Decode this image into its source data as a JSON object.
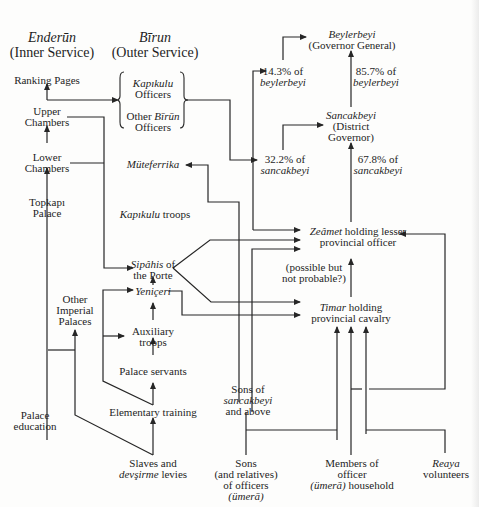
{
  "headers": {
    "enderun": {
      "italic": "Enderūn",
      "plain": "(Inner Service)"
    },
    "birun": {
      "italic": "Bīrun",
      "plain": "(Outer Service)"
    }
  },
  "inner_service": {
    "ranking_pages": "Ranking Pages",
    "upper_chambers": [
      "Upper",
      "Chambers"
    ],
    "lower_chambers": [
      "Lower",
      "Chambers"
    ],
    "topkapi_palace": [
      "Topkapı",
      "Palace"
    ],
    "other_imperial_palaces": [
      "Other",
      "Imperial",
      "Palaces"
    ],
    "palace_education": [
      "Palace",
      "education"
    ]
  },
  "outer_service": {
    "kapikulu_officers": {
      "italic": "Kapıkulu",
      "plain": "Officers"
    },
    "other_birun_officers": {
      "plain": "Other ",
      "italic": "Bīrūn",
      "line2": "Officers"
    },
    "muteferrika": "Müteferrika",
    "kapikulu_troops": {
      "italic": "Kapıkulu",
      "plain": " troops"
    },
    "sipahis": {
      "italic": "Sipâhis",
      "plain": " of",
      "line2": "the Porte"
    },
    "yeniceri": "Yeniçeri",
    "auxiliary_troops": [
      "Auxiliary",
      "troops"
    ],
    "palace_servants": "Palace servants",
    "elementary_training": "Elementary training",
    "slaves_levies": {
      "line1": "Slaves and",
      "italic": "devşirme",
      "plain": " levies"
    }
  },
  "provincial": {
    "beylerbeyi": {
      "italic": "Beylerbeyi",
      "plain": "(Governor General)"
    },
    "pct_14": {
      "value": "14.3% of",
      "italic": "beylerbeyi"
    },
    "pct_85": {
      "value": "85.7% of",
      "italic": "beylerbeyi"
    },
    "sancakbeyi": {
      "italic": "Sancakbeyi",
      "line2": "(District",
      "line3": "Governor)"
    },
    "pct_32": {
      "value": "32.2% of",
      "italic": "sancakbeyi"
    },
    "pct_67": {
      "value": "67.8% of",
      "italic": "sancakbeyi"
    },
    "zeamet": {
      "italic": "Zeâmet",
      "plain": " holding lesser",
      "line2": "provincial officer"
    },
    "possible": [
      "(possible but",
      "not probable?)"
    ],
    "timar": {
      "italic": "Timar",
      "plain": " holding",
      "line2": "provincial cavalry"
    }
  },
  "sources": {
    "sons_sancakbeyi": {
      "line1": "Sons of",
      "italic": "sancakbeyi",
      "line3": "and above"
    },
    "sons_officers": {
      "line1": "Sons",
      "line2": "(and relatives)",
      "line3": "of officers",
      "italic": "(ümerā)"
    },
    "household": {
      "line1": "Members of",
      "line2": "officer",
      "italic": "(ümerā)",
      "plain": " household"
    },
    "reaya": {
      "italic": "Reaya",
      "plain": "volunteers"
    }
  },
  "colors": {
    "line": "#262626",
    "text": "#1e1e1e",
    "background": "#fdfdfc"
  }
}
